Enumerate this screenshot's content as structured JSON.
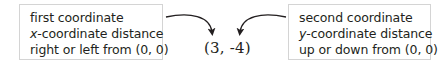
{
  "left_box": {
    "line1": "first coordinate",
    "line2_var": "x",
    "line2_rest": "-coordinate distance",
    "line3": "right or left from (0, 0)"
  },
  "right_box": {
    "line1": "second coordinate",
    "line2_var": "y",
    "line2_rest": "-coordinate distance",
    "line3": "up or down from (0, 0)"
  },
  "ordered_pair": "(3, -4)",
  "colors": {
    "text": "#231f20",
    "box_border": "#d4d4d4",
    "arrow": "#231f20"
  }
}
